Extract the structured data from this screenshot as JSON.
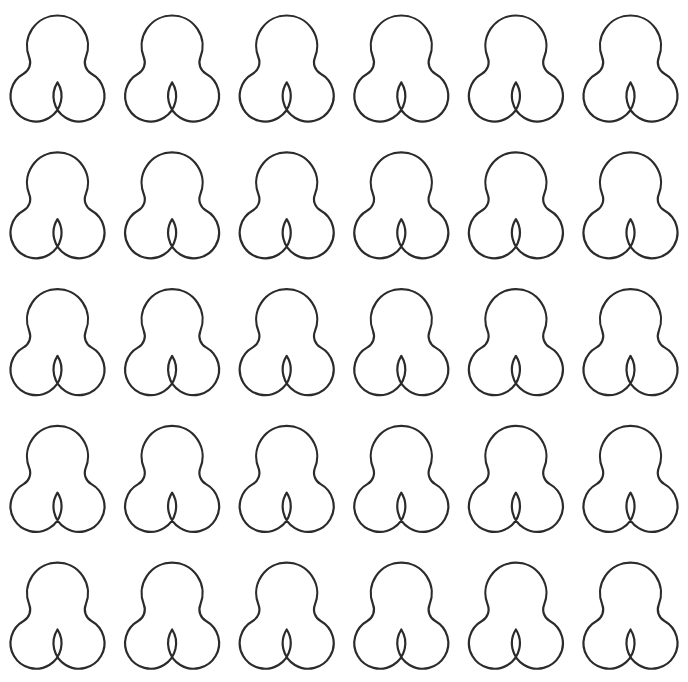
{
  "canvas": {
    "width": 688,
    "height": 682,
    "background_color": "#ffffff",
    "title": "Trefoil Shape Grid"
  },
  "pattern": {
    "name": "trefoil-clover-grid",
    "shape_name": "trefoil-outline",
    "description": "Grid of identical outlined trefoil (three-lobed clover) shapes",
    "columns": 6,
    "rows": 5,
    "total_shapes": 30,
    "stroke_color": "#2b2b2b",
    "fill_color": "#ffffff",
    "stroke_width": 2.2,
    "column_pitch": 114.6,
    "row_pitch": 136.8,
    "first_center_x": 57.5,
    "first_center_y": 68.5,
    "shape_geometry": {
      "top_lobe_center_dx": 0,
      "top_lobe_center_dy": -22.5,
      "top_lobe_radius": 30.5,
      "left_lobe_center_dx": -21.5,
      "left_lobe_center_dy": 27.5,
      "left_lobe_radius": 25.5,
      "right_lobe_center_dx": 21.5,
      "right_lobe_center_dy": 27.5,
      "right_lobe_radius": 25.5,
      "fillet_radius": 13,
      "bounding_width": 91,
      "bounding_height": 107
    },
    "shape_labels": [
      [
        "r1c1",
        "r1c2",
        "r1c3",
        "r1c4",
        "r1c5",
        "r1c6"
      ],
      [
        "r2c1",
        "r2c2",
        "r2c3",
        "r2c4",
        "r2c5",
        "r2c6"
      ],
      [
        "r3c1",
        "r3c2",
        "r3c3",
        "r3c4",
        "r3c5",
        "r3c6"
      ],
      [
        "r4c1",
        "r4c2",
        "r4c3",
        "r4c4",
        "r4c5",
        "r4c6"
      ],
      [
        "r5c1",
        "r5c2",
        "r5c3",
        "r5c4",
        "r5c5",
        "r5c6"
      ]
    ]
  }
}
